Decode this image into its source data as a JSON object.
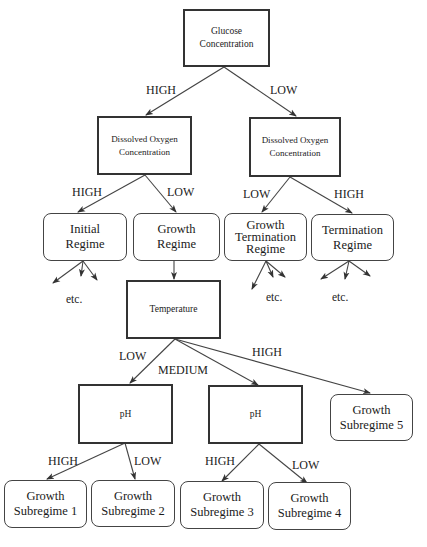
{
  "diagram": {
    "type": "decision-tree",
    "nodes": {
      "glucose": {
        "label": "Glucose Concentration",
        "shape": "rect"
      },
      "do_left": {
        "label": "Dissolved Oxygen Concentration",
        "shape": "rect"
      },
      "do_right": {
        "label": "Dissolved Oxygen Concentration",
        "shape": "rect"
      },
      "initial_regime": {
        "label": "Initial Regime",
        "shape": "rounded"
      },
      "growth_regime": {
        "label": "Growth Regime",
        "shape": "rounded"
      },
      "growth_termination_regime": {
        "label": "Growth Termination Regime",
        "shape": "rounded"
      },
      "termination_regime": {
        "label": "Termination Regime",
        "shape": "rounded"
      },
      "temperature": {
        "label": "Temperature",
        "shape": "rect"
      },
      "ph_left": {
        "label": "pH",
        "shape": "rect"
      },
      "ph_right": {
        "label": "pH",
        "shape": "rect"
      },
      "growth_subregime_1": {
        "label": "Growth Subregime 1",
        "shape": "rounded"
      },
      "growth_subregime_2": {
        "label": "Growth Subregime 2",
        "shape": "rounded"
      },
      "growth_subregime_3": {
        "label": "Growth Subregime 3",
        "shape": "rounded"
      },
      "growth_subregime_4": {
        "label": "Growth Subregime 4",
        "shape": "rounded"
      },
      "growth_subregime_5": {
        "label": "Growth Subregime 5",
        "shape": "rounded"
      }
    },
    "edges": [
      {
        "from": "glucose",
        "to": "do_left",
        "label": "HIGH"
      },
      {
        "from": "glucose",
        "to": "do_right",
        "label": "LOW"
      },
      {
        "from": "do_left",
        "to": "initial_regime",
        "label": "HIGH"
      },
      {
        "from": "do_left",
        "to": "growth_regime",
        "label": "LOW"
      },
      {
        "from": "do_right",
        "to": "growth_termination_regime",
        "label": "LOW"
      },
      {
        "from": "do_right",
        "to": "termination_regime",
        "label": "HIGH"
      },
      {
        "from": "growth_regime",
        "to": "temperature",
        "label": ""
      },
      {
        "from": "temperature",
        "to": "ph_left",
        "label": "LOW"
      },
      {
        "from": "temperature",
        "to": "ph_right",
        "label": "MEDIUM"
      },
      {
        "from": "temperature",
        "to": "growth_subregime_5",
        "label": "HIGH"
      },
      {
        "from": "ph_left",
        "to": "growth_subregime_1",
        "label": "HIGH"
      },
      {
        "from": "ph_left",
        "to": "growth_subregime_2",
        "label": "LOW"
      },
      {
        "from": "ph_right",
        "to": "growth_subregime_3",
        "label": "HIGH"
      },
      {
        "from": "ph_right",
        "to": "growth_subregime_4",
        "label": "LOW"
      }
    ],
    "continuation_label": "etc."
  },
  "labels": {
    "high": "HIGH",
    "low": "LOW",
    "medium": "MEDIUM",
    "etc": "etc.",
    "glucose_line1": "Glucose",
    "glucose_line2": "Concentration",
    "do_line1": "Dissolved Oxygen",
    "do_line2": "Concentration",
    "initial_line1": "Initial",
    "initial_line2": "Regime",
    "growth_line1": "Growth",
    "growth_line2": "Regime",
    "gtr_line1": "Growth",
    "gtr_line2": "Termination",
    "gtr_line3": "Regime",
    "term_line1": "Termination",
    "term_line2": "Regime",
    "temperature": "Temperature",
    "ph": "pH",
    "gs_line1": "Growth",
    "gs1_line2": "Subregime 1",
    "gs2_line2": "Subregime 2",
    "gs3_line2": "Subregime 3",
    "gs4_line2": "Subregime 4",
    "gs5_line2": "Subregime 5"
  },
  "colors": {
    "line": "#333333",
    "background": "#ffffff",
    "text": "#1a1a1a"
  }
}
